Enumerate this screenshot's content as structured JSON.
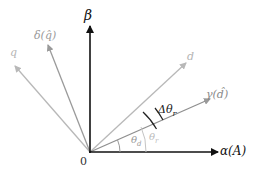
{
  "diagram": {
    "origin_label": "0",
    "axes": {
      "beta": {
        "label": "β",
        "color": "#111111"
      },
      "alpha": {
        "label": "α(A)",
        "color": "#111111"
      }
    },
    "vectors": {
      "q": {
        "label": "q",
        "color": "#b5b5b5"
      },
      "delta_q_hat": {
        "label": "δ(q̂)",
        "color": "#9a9a9a"
      },
      "d": {
        "label": "d",
        "color": "#b5b5b5"
      },
      "gamma_d_hat": {
        "label": "γ(d̂)",
        "color": "#8a8a8a"
      }
    },
    "angles": {
      "delta_theta_r": {
        "label": "Δθr",
        "base": "Δθ",
        "sub": "r"
      },
      "theta_d": {
        "label": "θd",
        "base": "θ",
        "sub": "d"
      },
      "theta_r": {
        "label": "θr",
        "base": "θ",
        "sub": "r"
      }
    }
  }
}
